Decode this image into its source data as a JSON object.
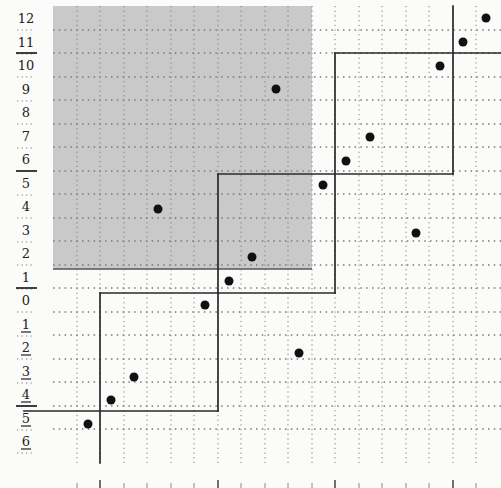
{
  "diagram": {
    "type": "permutation-grid-staircase",
    "colors": {
      "background": "#fbfbfa",
      "shaded_region": "#c9c9c9",
      "grid_dots": "#7a7a7a",
      "lines": "#2a2a2a",
      "points": "#111111"
    },
    "row_labels": [
      {
        "text": "12",
        "underlined": false,
        "y": 18
      },
      {
        "text": "11",
        "underlined": false,
        "y": 42
      },
      {
        "text": "10",
        "underlined": false,
        "y": 65
      },
      {
        "text": "9",
        "underlined": false,
        "y": 89
      },
      {
        "text": "8",
        "underlined": false,
        "y": 112
      },
      {
        "text": "7",
        "underlined": false,
        "y": 136
      },
      {
        "text": "6",
        "underlined": false,
        "y": 159
      },
      {
        "text": "5",
        "underlined": false,
        "y": 183
      },
      {
        "text": "4",
        "underlined": false,
        "y": 206
      },
      {
        "text": "3",
        "underlined": false,
        "y": 230
      },
      {
        "text": "2",
        "underlined": false,
        "y": 253
      },
      {
        "text": "1",
        "underlined": false,
        "y": 277
      },
      {
        "text": "0",
        "underlined": false,
        "y": 300
      },
      {
        "text": "1",
        "underlined": true,
        "y": 324
      },
      {
        "text": "2",
        "underlined": true,
        "y": 347
      },
      {
        "text": "3",
        "underlined": true,
        "y": 371
      },
      {
        "text": "4",
        "underlined": true,
        "y": 394
      },
      {
        "text": "5",
        "underlined": true,
        "y": 418
      },
      {
        "text": "6",
        "underlined": true,
        "y": 441
      }
    ],
    "label_separators_y": [
      53,
      171,
      288,
      406
    ],
    "shaded_region": {
      "x": 53,
      "y": 6,
      "width": 259,
      "height": 263
    },
    "grid": {
      "vertical_x": [
        77,
        100,
        124,
        147,
        171,
        194,
        218,
        241,
        265,
        288,
        312,
        335,
        359,
        382,
        406,
        429,
        453,
        476
      ],
      "horizontal_y": [
        30,
        53,
        77,
        100,
        124,
        147,
        171,
        194,
        218,
        241,
        265,
        288,
        312,
        335,
        359,
        382,
        406,
        429
      ],
      "x_start": 53,
      "x_end": 501,
      "y_start": 6,
      "y_end": 463
    },
    "bottom_ticks_x": [
      77,
      100,
      124,
      147,
      171,
      194,
      218,
      241,
      265,
      288,
      312,
      335,
      359,
      382,
      406,
      429,
      453,
      476
    ],
    "major_ticks_x": [
      100,
      218,
      335,
      453
    ],
    "staircase_segments": [
      {
        "x1": 24,
        "y1": 411,
        "x2": 218,
        "y2": 411
      },
      {
        "x1": 218,
        "y1": 411,
        "x2": 218,
        "y2": 174
      },
      {
        "x1": 218,
        "y1": 174,
        "x2": 453,
        "y2": 174
      },
      {
        "x1": 453,
        "y1": 174,
        "x2": 453,
        "y2": 6
      },
      {
        "x1": 100,
        "y1": 463,
        "x2": 100,
        "y2": 293
      },
      {
        "x1": 100,
        "y1": 293,
        "x2": 335,
        "y2": 293
      },
      {
        "x1": 335,
        "y1": 293,
        "x2": 335,
        "y2": 53
      },
      {
        "x1": 335,
        "y1": 53,
        "x2": 501,
        "y2": 53
      }
    ],
    "points": [
      {
        "x": 486,
        "y": 18
      },
      {
        "x": 463,
        "y": 42
      },
      {
        "x": 440,
        "y": 66
      },
      {
        "x": 276,
        "y": 89
      },
      {
        "x": 370,
        "y": 137
      },
      {
        "x": 346,
        "y": 161
      },
      {
        "x": 323,
        "y": 185
      },
      {
        "x": 158,
        "y": 209
      },
      {
        "x": 416,
        "y": 233
      },
      {
        "x": 252,
        "y": 257
      },
      {
        "x": 229,
        "y": 281
      },
      {
        "x": 205,
        "y": 305
      },
      {
        "x": 299,
        "y": 353
      },
      {
        "x": 134,
        "y": 377
      },
      {
        "x": 111,
        "y": 400
      },
      {
        "x": 88,
        "y": 424
      }
    ]
  }
}
